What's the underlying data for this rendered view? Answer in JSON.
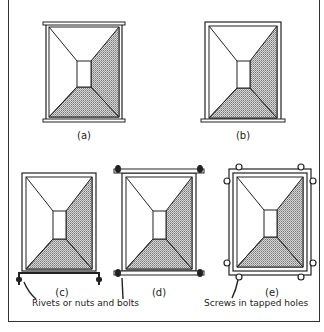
{
  "figure": {
    "panels": [
      {
        "id": "a",
        "label": "(a)",
        "joint": "flanges top and bottom"
      },
      {
        "id": "b",
        "label": "(b)",
        "joint": "folded edges with bottom flange"
      },
      {
        "id": "c",
        "label": "(c)",
        "joint": "rivets or nuts and bolts, bottom"
      },
      {
        "id": "d",
        "label": "(d)",
        "joint": "nuts and bolts, top and bottom"
      },
      {
        "id": "e",
        "label": "(e)",
        "joint": "screws in tapped holes"
      }
    ],
    "callouts": {
      "rivets": "Rivets or nuts and bolts",
      "screws": "Screws in tapped holes"
    },
    "colors": {
      "line": "#222222",
      "hatch": "#9a9a9a",
      "background": "#ffffff"
    }
  }
}
